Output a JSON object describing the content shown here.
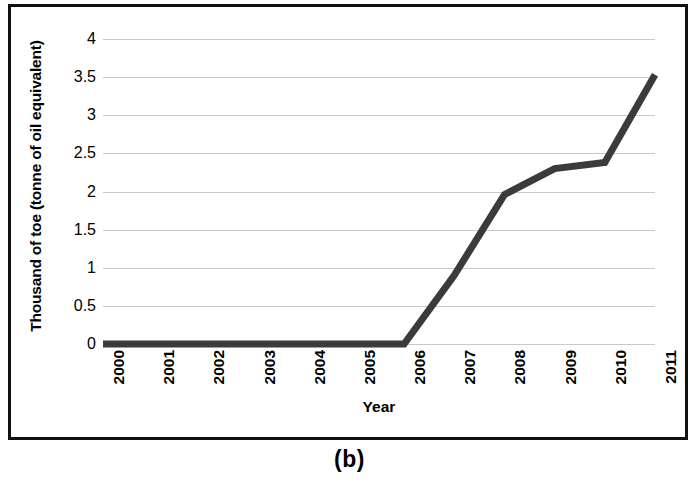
{
  "figure": {
    "caption": "(b)",
    "border_color": "#111111",
    "background": "#ffffff"
  },
  "chart_data": {
    "type": "line",
    "title": "",
    "subtitle": "",
    "xlabel": "Year",
    "ylabel": "Thousand of toe (tonne of oil equivalent)",
    "categories": [
      "2000",
      "2001",
      "2002",
      "2003",
      "2004",
      "2005",
      "2006",
      "2007",
      "2008",
      "2009",
      "2010",
      "2011"
    ],
    "x": [
      2000,
      2001,
      2002,
      2003,
      2004,
      2005,
      2006,
      2007,
      2008,
      2009,
      2010,
      2011
    ],
    "values": [
      0,
      0,
      0,
      0,
      0,
      0,
      0,
      0.9,
      1.96,
      2.3,
      2.38,
      3.53
    ],
    "series": [
      {
        "name": "Thousand of toe",
        "values": [
          0,
          0,
          0,
          0,
          0,
          0,
          0,
          0.9,
          1.96,
          2.3,
          2.38,
          3.53
        ],
        "color": "#3b3b3b",
        "line_width": 7
      }
    ],
    "ylim": [
      0,
      4
    ],
    "xlim": [
      2000,
      2011
    ],
    "yticks": [
      0,
      0.5,
      1,
      1.5,
      2,
      2.5,
      3,
      3.5,
      4
    ],
    "ytick_labels": [
      "0",
      "0.5",
      "1",
      "1.5",
      "2",
      "2.5",
      "3",
      "3.5",
      "4"
    ],
    "xtick_labels": [
      "2000",
      "2001",
      "2002",
      "2003",
      "2004",
      "2005",
      "2006",
      "2007",
      "2008",
      "2009",
      "2010",
      "2011"
    ],
    "grid": {
      "horizontal": true,
      "vertical": false,
      "color": "#c9c9c9"
    },
    "legend": {
      "visible": false,
      "position": "none"
    },
    "annotations": []
  }
}
